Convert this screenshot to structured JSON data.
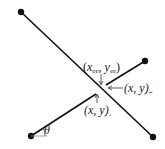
{
  "diagram": {
    "colors": {
      "line": "#111111",
      "thin": "#555555",
      "background": "#ffffff"
    },
    "labels": {
      "ee_point": {
        "open": "(",
        "x": "x",
        "x_sub": "ee",
        "comma": ", ",
        "y": "y",
        "y_sub": "ee",
        "close": ")"
      },
      "plus_point": {
        "text": "(x, y)",
        "sub": "+"
      },
      "minus_point": {
        "text": "(x, y)",
        "sub": "-"
      },
      "angle": "θ"
    }
  }
}
